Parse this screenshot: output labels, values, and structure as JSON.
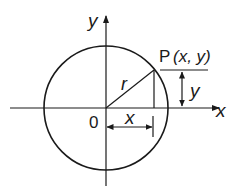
{
  "diagram": {
    "type": "unit-circle-coordinates",
    "labels": {
      "y_axis": "y",
      "x_axis": "x",
      "origin": "0",
      "radius": "r",
      "point_name": "P",
      "point_coords": "(x, y)",
      "vertical_measure": "y",
      "horizontal_measure": "x"
    },
    "colors": {
      "stroke": "#1a1a1a",
      "background": "#ffffff"
    }
  }
}
